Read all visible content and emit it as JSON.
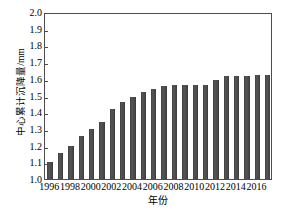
{
  "chart_data": {
    "type": "bar",
    "title": "",
    "xlabel": "年份",
    "ylabel": "中心累计沉降量/mm",
    "categories": [
      "1996",
      "1997",
      "1998",
      "1999",
      "2000",
      "2001",
      "2002",
      "2003",
      "2004",
      "2005",
      "2006",
      "2007",
      "2008",
      "2009",
      "2010",
      "2011",
      "2012",
      "2013",
      "2014",
      "2015",
      "2016",
      "2017"
    ],
    "values": [
      1.1,
      1.155,
      1.2,
      1.255,
      1.3,
      1.34,
      1.42,
      1.46,
      1.49,
      1.52,
      1.54,
      1.555,
      1.56,
      1.56,
      1.56,
      1.565,
      1.59,
      1.615,
      1.615,
      1.615,
      1.62,
      1.62
    ],
    "ylim": [
      1.0,
      2.0
    ],
    "ytick_values": [
      1.0,
      1.1,
      1.2,
      1.3,
      1.4,
      1.5,
      1.6,
      1.7,
      1.8,
      1.9,
      2.0
    ],
    "ytick_labels": [
      "1.0",
      "1.1",
      "1.2",
      "1.3",
      "1.4",
      "1.5",
      "1.6",
      "1.7",
      "1.8",
      "1.9",
      "2.0"
    ],
    "xtick_labels": [
      "1996",
      "1998",
      "2000",
      "2002",
      "2004",
      "2006",
      "2008",
      "2010",
      "2012",
      "2014",
      "2016"
    ],
    "xtick_categories": [
      "1996",
      "1998",
      "2000",
      "2002",
      "2004",
      "2006",
      "2008",
      "2010",
      "2012",
      "2014",
      "2016"
    ],
    "grid": false,
    "legend": null,
    "bar_color": "#4a4a4a",
    "axis_color": "#4d4d4d"
  }
}
